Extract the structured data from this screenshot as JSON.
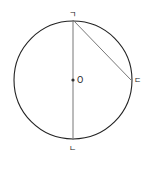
{
  "diagram": {
    "type": "geometry-circle",
    "circle": {
      "cx": 73,
      "cy": 80,
      "r": 59,
      "stroke": "#222222"
    },
    "center": {
      "label": "O",
      "x": 73,
      "y": 80
    },
    "points": [
      {
        "id": "top",
        "label": "ㄱ",
        "x": 73,
        "y": 20
      },
      {
        "id": "bottom",
        "label": "ㄴ",
        "x": 73,
        "y": 140
      },
      {
        "id": "right",
        "label": "ㄷ",
        "x": 131,
        "y": 80
      }
    ],
    "segments": [
      {
        "from": "ㄱ",
        "to": "ㄴ",
        "kind": "diameter",
        "stroke": "#777777"
      },
      {
        "from": "ㄱ",
        "to": "ㄷ",
        "kind": "chord",
        "stroke": "#777777"
      }
    ]
  }
}
